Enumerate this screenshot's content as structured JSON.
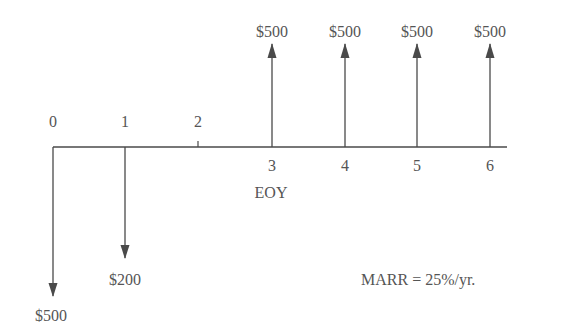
{
  "diagram": {
    "type": "cash-flow-diagram",
    "axis_label": "EOY",
    "marr_label": "MARR = 25%/yr.",
    "periods": [
      "0",
      "1",
      "2",
      "3",
      "4",
      "5",
      "6"
    ],
    "cash_flows": [
      {
        "period": "0",
        "amount": "$500",
        "direction": "down"
      },
      {
        "period": "1",
        "amount": "$200",
        "direction": "down"
      },
      {
        "period": "3",
        "amount": "$500",
        "direction": "up"
      },
      {
        "period": "4",
        "amount": "$500",
        "direction": "up"
      },
      {
        "period": "5",
        "amount": "$500",
        "direction": "up"
      },
      {
        "period": "6",
        "amount": "$500",
        "direction": "up"
      }
    ],
    "line_color": "#4a4a4a"
  }
}
